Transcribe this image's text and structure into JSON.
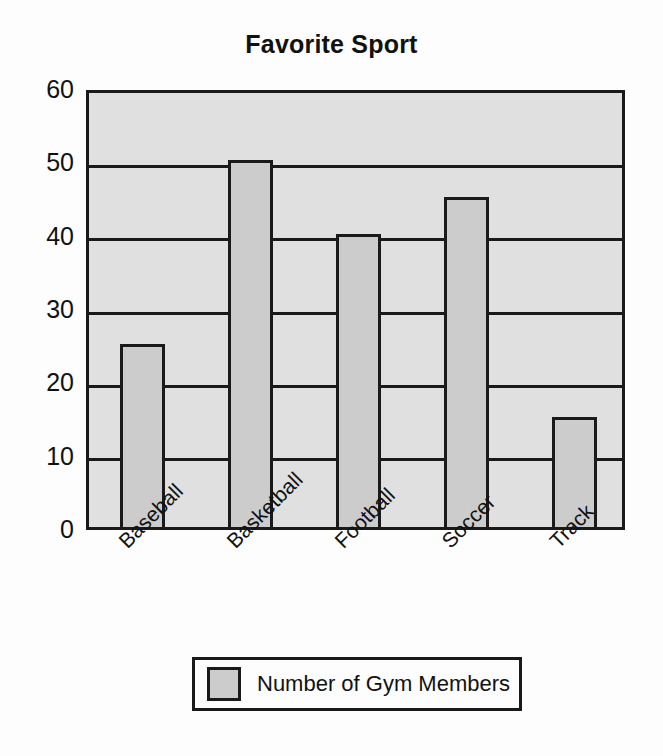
{
  "chart_data": {
    "type": "bar",
    "title": "Favorite Sport",
    "xlabel": "",
    "ylabel": "",
    "categories": [
      "Baseball",
      "Basketball",
      "Football",
      "Soccer",
      "Track"
    ],
    "values": [
      25,
      50,
      40,
      45,
      15
    ],
    "series": [
      {
        "name": "Number of Gym Members",
        "values": [
          25,
          50,
          40,
          45,
          15
        ]
      }
    ],
    "ylim": [
      0,
      60
    ],
    "yticks": [
      0,
      10,
      20,
      30,
      40,
      50,
      60
    ],
    "ytick_labels": [
      "0",
      "10",
      "20",
      "30",
      "40",
      "50",
      "60"
    ],
    "grid": true,
    "grid_axis": "y",
    "legend": {
      "position": "bottom",
      "entries": [
        {
          "label": "Number of Gym Members",
          "color": "#cccccc"
        }
      ]
    },
    "colors": {
      "bar_fill": "#cccccc",
      "bar_edge": "#1a1a1a",
      "plot_background": "#e0e0e0",
      "figure_background": "#fdfdfd",
      "text": "#111111"
    },
    "xtick_rotation": -45
  }
}
